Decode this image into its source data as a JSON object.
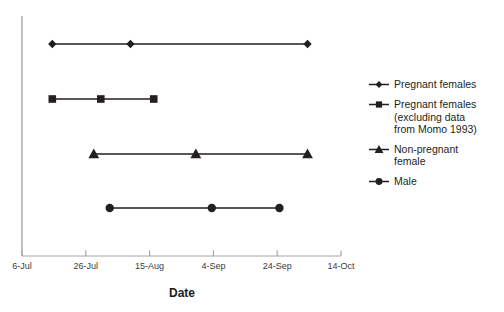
{
  "chart_data": {
    "type": "scatter",
    "title": "",
    "xlabel": "Date",
    "ylabel": "",
    "grid": false,
    "legend_position": "right",
    "x_tick_labels": [
      "6-Jul",
      "26-Jul",
      "15-Aug",
      "4-Sep",
      "24-Sep",
      "14-Oct"
    ],
    "x_tick_days": [
      0,
      20,
      40,
      60,
      80,
      100
    ],
    "xlim_days": [
      0,
      100
    ],
    "series": [
      {
        "name": "Pregnant females",
        "marker": "diamond",
        "row": 1,
        "x_labels": [
          "16-Jul",
          "10-Aug",
          "5-Oct"
        ],
        "x_days": [
          9.5,
          34,
          89.5
        ],
        "color": "#231f20"
      },
      {
        "name": "Pregnant females (excluding data from Momo 1993)",
        "marker": "square",
        "row": 2,
        "x_labels": [
          "16-Jul",
          "31-Jul",
          "17-Aug",
          ""
        ],
        "x_days": [
          9.5,
          24.7,
          41.3
        ],
        "color": "#231f20"
      },
      {
        "name": "Non-pregnant female",
        "marker": "triangle",
        "row": 3,
        "x_labels": [
          "29-Jul",
          "31-Aug",
          "5-Oct"
        ],
        "x_days": [
          22.5,
          54.5,
          89.5
        ],
        "color": "#231f20"
      },
      {
        "name": "Male",
        "marker": "circle",
        "row": 4,
        "x_labels": [
          "4-Aug",
          "5-Sep",
          "26-Sep"
        ],
        "x_days": [
          27.5,
          59.5,
          80.7
        ],
        "color": "#231f20"
      }
    ]
  },
  "axis": {
    "x_title": "Date",
    "ticks": [
      {
        "label": "6-Jul"
      },
      {
        "label": "26-Jul"
      },
      {
        "label": "15-Aug"
      },
      {
        "label": "4-Sep"
      },
      {
        "label": "24-Sep"
      },
      {
        "label": "14-Oct"
      }
    ]
  },
  "legend": {
    "entries": [
      {
        "label": "Pregnant females",
        "marker": "diamond"
      },
      {
        "label": "Pregnant females\n(excluding data\nfrom Momo 1993)",
        "marker": "square"
      },
      {
        "label": "Non-pregnant\nfemale",
        "marker": "triangle"
      },
      {
        "label": "Male",
        "marker": "circle"
      }
    ]
  },
  "colors": {
    "axis": "#a6a6a6",
    "series": "#231f20",
    "text": "#231f20",
    "background": "#ffffff"
  }
}
